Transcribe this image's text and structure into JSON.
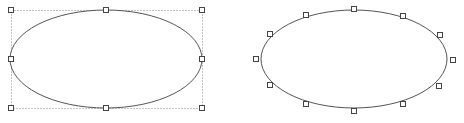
{
  "canvas": {
    "width": 464,
    "height": 123,
    "background": "#ffffff"
  },
  "colors": {
    "stroke": "#555555",
    "handle_stroke": "#444444",
    "handle_fill": "#ffffff",
    "bbox": "#888888"
  },
  "shapes": [
    {
      "name": "ellipse-bbox-selection",
      "cx": 106,
      "cy": 59,
      "rx": 96,
      "ry": 49,
      "bbox": {
        "x": 11,
        "y": 10,
        "w": 191,
        "h": 98
      },
      "handles": [
        [
          11,
          10
        ],
        [
          106,
          10
        ],
        [
          202,
          10
        ],
        [
          11,
          59
        ],
        [
          202,
          59
        ],
        [
          11,
          108
        ],
        [
          106,
          108
        ],
        [
          202,
          108
        ]
      ]
    },
    {
      "name": "ellipse-point-edit",
      "cx": 354,
      "cy": 59,
      "rx": 93,
      "ry": 49,
      "handles": [
        [
          354,
          9
        ],
        [
          403,
          16
        ],
        [
          440,
          35
        ],
        [
          453,
          60
        ],
        [
          439,
          86
        ],
        [
          403,
          104
        ],
        [
          354,
          111
        ],
        [
          306,
          104
        ],
        [
          270,
          85
        ],
        [
          256,
          59
        ],
        [
          270,
          34
        ],
        [
          306,
          15
        ]
      ]
    }
  ]
}
